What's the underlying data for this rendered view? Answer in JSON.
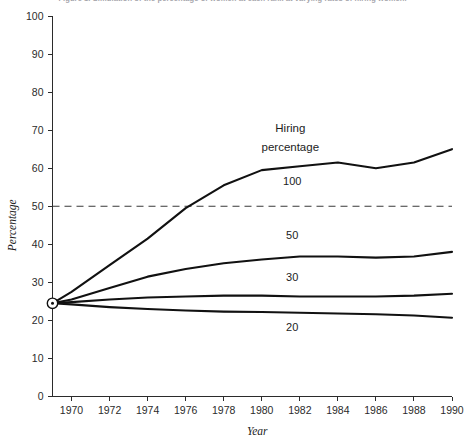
{
  "figure": {
    "caption_partial": "Figure 1. Simulation of the percentage of women at each rank at varying rates of hiring women."
  },
  "chart_data": {
    "type": "line",
    "title": "",
    "xlabel": "Year",
    "ylabel": "Percentage",
    "xlim": [
      1969,
      1990
    ],
    "ylim": [
      0,
      100
    ],
    "grid": false,
    "legend_position": "inline-labels",
    "legend_title": "Hiring percentage",
    "x_ticks": [
      "1970",
      "1972",
      "1974",
      "1976",
      "1978",
      "1980",
      "1982",
      "1984",
      "1986",
      "1988",
      "1990"
    ],
    "x_tick_values": [
      1970,
      1972,
      1974,
      1976,
      1978,
      1980,
      1982,
      1984,
      1986,
      1988,
      1990
    ],
    "y_ticks": [
      "0",
      "10",
      "20",
      "30",
      "40",
      "50",
      "60",
      "70",
      "80",
      "90",
      "100"
    ],
    "y_tick_values": [
      0,
      10,
      20,
      30,
      40,
      50,
      60,
      70,
      80,
      90,
      100
    ],
    "origin_marker": {
      "x": 1969,
      "y": 24.5,
      "label": "start"
    },
    "reference_line": {
      "y": 50,
      "style": "dashed",
      "label": ""
    },
    "series": [
      {
        "name": "100",
        "label": "100",
        "label_x": 1981.6,
        "label_y": 55.5,
        "x": [
          1969,
          1970,
          1972,
          1974,
          1976,
          1978,
          1980,
          1982,
          1984,
          1986,
          1988,
          1990
        ],
        "values": [
          24.5,
          27.5,
          34.5,
          41.5,
          49.5,
          55.5,
          59.5,
          60.5,
          61.5,
          60.0,
          61.5,
          65.0
        ]
      },
      {
        "name": "50",
        "label": "50",
        "label_x": 1981.6,
        "label_y": 41.5,
        "x": [
          1969,
          1970,
          1972,
          1974,
          1976,
          1978,
          1980,
          1982,
          1984,
          1986,
          1988,
          1990
        ],
        "values": [
          24.5,
          25.5,
          28.5,
          31.5,
          33.5,
          35.0,
          36.0,
          36.8,
          36.8,
          36.5,
          36.8,
          38.0
        ]
      },
      {
        "name": "30",
        "label": "30",
        "label_x": 1981.6,
        "label_y": 30.3,
        "x": [
          1969,
          1970,
          1972,
          1974,
          1976,
          1978,
          1980,
          1982,
          1984,
          1986,
          1988,
          1990
        ],
        "values": [
          24.5,
          24.8,
          25.5,
          26.0,
          26.3,
          26.5,
          26.5,
          26.3,
          26.3,
          26.3,
          26.5,
          27.0
        ]
      },
      {
        "name": "20",
        "label": "20",
        "label_x": 1981.6,
        "label_y": 17.3,
        "x": [
          1969,
          1970,
          1972,
          1974,
          1976,
          1978,
          1980,
          1982,
          1984,
          1986,
          1988,
          1990
        ],
        "values": [
          24.5,
          24.2,
          23.5,
          23.0,
          22.6,
          22.3,
          22.2,
          22.0,
          21.8,
          21.6,
          21.3,
          20.7
        ]
      }
    ]
  },
  "legend": {
    "title_line1": "Hiring",
    "title_line2": "percentage",
    "title_x": 1981.5,
    "title_y1": 69.5,
    "title_y2": 64.5
  }
}
